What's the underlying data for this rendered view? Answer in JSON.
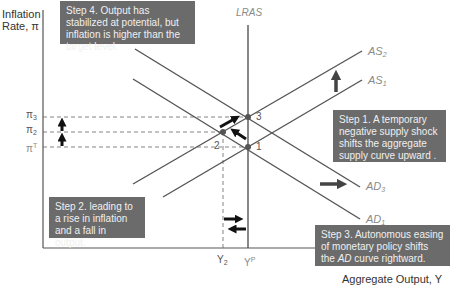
{
  "axes": {
    "y_label_line1": "Inflation",
    "y_label_line2": "Rate, π",
    "x_label": "Aggregate Output, Y"
  },
  "curves": {
    "lras": "LRAS",
    "as2": "AS",
    "as2_sub": "2",
    "as1": "AS",
    "as1_sub": "1",
    "ad3": "AD",
    "ad3_sub": "3",
    "ad1": "AD",
    "ad1_sub": "1"
  },
  "ticks": {
    "pi3": "π",
    "pi3_sub": "3",
    "pi2": "π",
    "pi2_sub": "2",
    "piT": "π",
    "piT_sup": "T",
    "y2": "Y",
    "y2_sub": "2",
    "yp": "Y",
    "yp_sup": "P"
  },
  "points": {
    "p1": "1",
    "p2": "2",
    "p3": "3"
  },
  "steps": {
    "step1": "Step 1. A temporary negative supply shock shifts the aggregate supply curve upward . . .",
    "step2": "Step 2. leading to a rise in inflation and a fall in output.",
    "step3_a": "Step 3. Autonomous easing of monetary policy shifts the ",
    "step3_ad": "AD",
    "step3_b": " curve rightward.",
    "step4": "Step 4. Output has stabilized at potential, but inflation is higher than the target level."
  },
  "colors": {
    "line": "#555555",
    "box": "#6b6b6b",
    "arrow": "#111111",
    "shift_arrow": "#444444"
  }
}
